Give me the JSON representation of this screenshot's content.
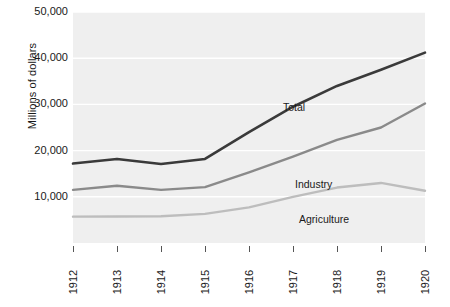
{
  "chart_data": {
    "type": "line",
    "title": "",
    "subtitle": "",
    "xlabel": "",
    "ylabel": "Millions of dollars",
    "x": [
      1912,
      1913,
      1914,
      1915,
      1916,
      1917,
      1918,
      1919,
      1920
    ],
    "categories": [
      "1912",
      "1913",
      "1914",
      "1915",
      "1916",
      "1917",
      "1918",
      "1919",
      "1920"
    ],
    "xlim": [
      1912,
      1920
    ],
    "ylim": [
      0,
      50000
    ],
    "y_ticks": [
      10000,
      20000,
      30000,
      40000,
      50000
    ],
    "y_tick_labels": [
      "10,000",
      "20,000",
      "30,000",
      "40,000",
      "50,000"
    ],
    "grid": true,
    "grid_axis": "y",
    "legend": "inline-annotations",
    "legend_position": "inside-plot",
    "plot_background": "#efefef",
    "series": [
      {
        "name": "Total",
        "color": "#3a3a3a",
        "values": [
          17200,
          18200,
          17100,
          18200,
          24000,
          29500,
          34000,
          37500,
          41200
        ]
      },
      {
        "name": "Industry",
        "color": "#8a8a8a",
        "values": [
          11500,
          12400,
          11500,
          12100,
          15300,
          18700,
          22300,
          25000,
          30200
        ]
      },
      {
        "name": "Agriculture",
        "color": "#bdbdbd",
        "values": [
          5700,
          5750,
          5800,
          6300,
          7700,
          10000,
          12000,
          13000,
          11300
        ]
      }
    ],
    "annotations": [
      {
        "text": "Total",
        "series": "Total",
        "x_px": 283,
        "y_px": 101
      },
      {
        "text": "Industry",
        "series": "Industry",
        "x_px": 295,
        "y_px": 178
      },
      {
        "text": "Agriculture",
        "series": "Agriculture",
        "x_px": 299,
        "y_px": 213
      }
    ]
  }
}
